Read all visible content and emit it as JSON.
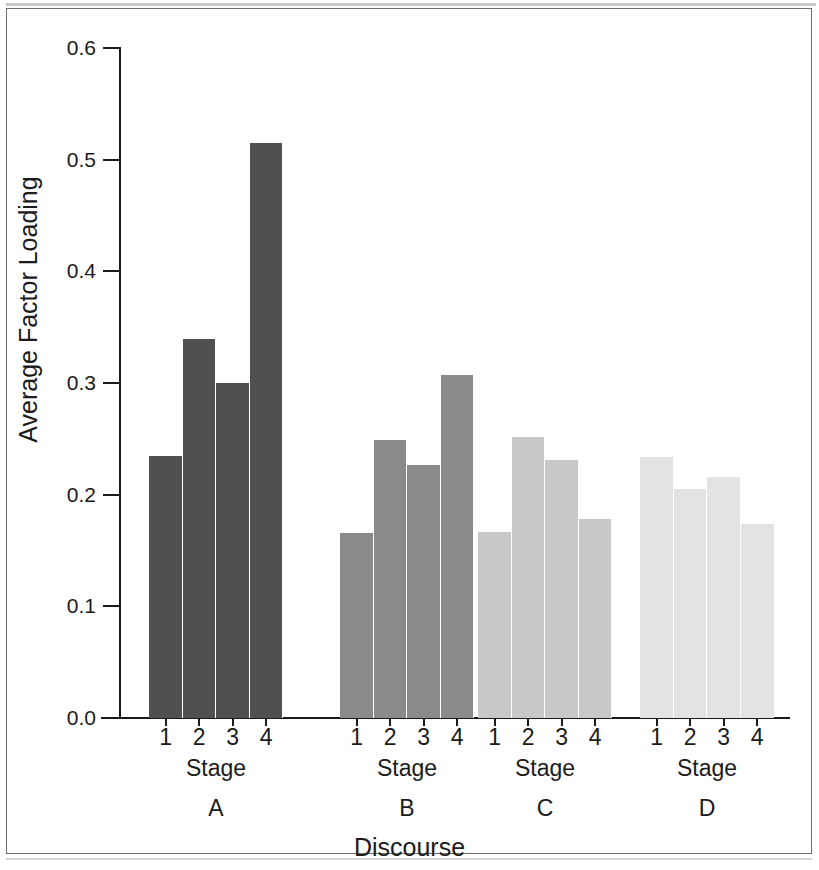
{
  "chart_data": {
    "type": "bar",
    "title": "",
    "xlabel": "Discourse",
    "ylabel": "Average Factor Loading",
    "ylim": [
      0.0,
      0.6
    ],
    "ytick_labels": [
      "0.0",
      "0.1",
      "0.2",
      "0.3",
      "0.4",
      "0.5",
      "0.6"
    ],
    "ytick_values": [
      0.0,
      0.1,
      0.2,
      0.3,
      0.4,
      0.5,
      0.6
    ],
    "grid": false,
    "legend": "none",
    "group_axis_label": "Stage",
    "categories": [
      "1",
      "2",
      "3",
      "4"
    ],
    "groups": [
      {
        "name": "A",
        "sublabel": "Stage",
        "color": "#505050",
        "values": [
          0.235,
          0.339,
          0.3,
          0.515
        ]
      },
      {
        "name": "B",
        "sublabel": "Stage",
        "color": "#8a8a8a",
        "values": [
          0.166,
          0.249,
          0.227,
          0.307
        ]
      },
      {
        "name": "C",
        "sublabel": "Stage",
        "color": "#c8c8c8",
        "values": [
          0.167,
          0.252,
          0.231,
          0.178
        ]
      },
      {
        "name": "D",
        "sublabel": "Stage",
        "color": "#e3e3e3",
        "values": [
          0.234,
          0.205,
          0.216,
          0.174
        ]
      }
    ]
  },
  "layout": {
    "plot_left": 120,
    "plot_top": 48,
    "plot_width": 670,
    "plot_height": 670,
    "group_spans": [
      {
        "left": 149,
        "right": 283
      },
      {
        "left": 340,
        "right": 474
      },
      {
        "left": 478,
        "right": 612
      },
      {
        "left": 640,
        "right": 774
      }
    ]
  }
}
